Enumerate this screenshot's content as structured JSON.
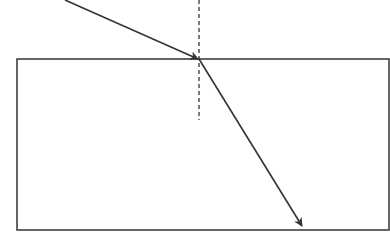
{
  "diagram": {
    "type": "refraction",
    "colors": {
      "line": "#333333",
      "background": "#ffffff"
    },
    "medium_block": {
      "x": 17,
      "y": 59,
      "width": 372,
      "height": 171
    },
    "incident_point": {
      "x": 199,
      "y": 59
    },
    "incident_ray": {
      "x1": 65,
      "y1": 0,
      "x2": 199,
      "y2": 59
    },
    "refracted_ray": {
      "x1": 199,
      "y1": 59,
      "x2": 302,
      "y2": 226
    },
    "normal_line": {
      "x": 199,
      "y1": 0,
      "y2": 120,
      "style": "dashed"
    }
  }
}
